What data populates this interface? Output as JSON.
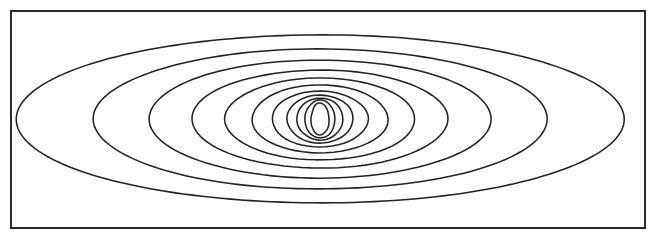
{
  "figure": {
    "title": "",
    "width": 655,
    "height": 236,
    "background_color": "#ffffff",
    "line_color": "#222222",
    "frame_color": "#2a2a2a"
  },
  "frame": {
    "label": "plot-frame",
    "x": 11,
    "y": 11,
    "width": 634,
    "height": 217,
    "stroke_width": 2
  },
  "chart_data": {
    "type": "line",
    "subtype": "contour",
    "title": "",
    "xlabel": "",
    "ylabel": "",
    "grid": false,
    "legend": false,
    "legend_position": "none",
    "xlim": [
      11,
      645
    ],
    "ylim": [
      11,
      228
    ],
    "center": {
      "x": 320,
      "y": 119
    },
    "contour_count": 11,
    "contours": [
      {
        "level": 11,
        "rx": 304,
        "ry": 84
      },
      {
        "level": 10,
        "rx": 227,
        "ry": 70
      },
      {
        "level": 9,
        "rx": 171,
        "ry": 59
      },
      {
        "level": 8,
        "rx": 128,
        "ry": 49
      },
      {
        "level": 7,
        "rx": 95,
        "ry": 41
      },
      {
        "level": 6,
        "rx": 68,
        "ry": 34
      },
      {
        "level": 5,
        "rx": 48,
        "ry": 28
      },
      {
        "level": 4,
        "rx": 33,
        "ry": 24
      },
      {
        "level": 3,
        "rx": 23,
        "ry": 21
      },
      {
        "level": 2,
        "rx": 15,
        "ry": 19
      },
      {
        "level": 1,
        "rx": 9,
        "ry": 16
      }
    ]
  }
}
